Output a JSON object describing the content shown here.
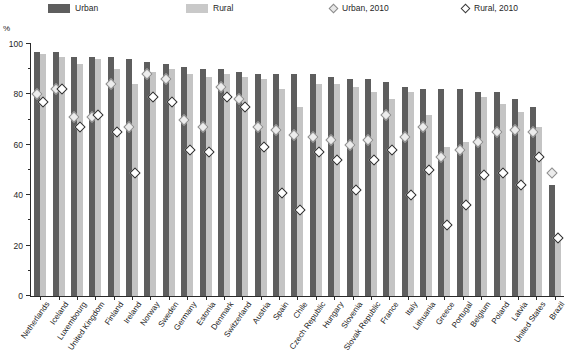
{
  "chart_data": {
    "type": "bar",
    "title": "",
    "subtitle": "",
    "xlabel": "",
    "ylabel": "%",
    "ylim": [
      0,
      100
    ],
    "ytick_values": [
      0,
      20,
      40,
      60,
      80,
      100
    ],
    "ytick_labels": [
      "0",
      "20",
      "40",
      "60",
      "80",
      "100"
    ],
    "yminor_values": [
      10,
      30,
      50,
      70,
      90
    ],
    "grid": false,
    "legend_position": "top",
    "categories": [
      "Netherlands",
      "Iceland",
      "Luxembourg",
      "United Kingdom",
      "Finland",
      "Ireland",
      "Norway",
      "Sweden",
      "Germany",
      "Estonia",
      "Denmark",
      "Switzerland",
      "Austria",
      "Spain",
      "Chile",
      "Czech Republic",
      "Hungary",
      "Slovenia",
      "Slovak Republic",
      "France",
      "Italy",
      "Lithuania",
      "Greece",
      "Portugal",
      "Belgium",
      "Poland",
      "Latvia",
      "United States",
      "Brazil"
    ],
    "series": [
      {
        "name": "Urban",
        "type": "bar",
        "color": "#5e5e5e",
        "values": [
          97,
          97,
          95,
          95,
          95,
          94,
          93,
          92,
          91,
          90,
          90,
          89,
          88,
          88,
          88,
          88,
          87,
          86,
          86,
          85,
          83,
          82,
          82,
          82,
          81,
          81,
          78,
          75,
          44
        ]
      },
      {
        "name": "Rural",
        "type": "bar",
        "color": "#c4c4c4",
        "values": [
          96,
          95,
          92,
          94,
          90,
          84,
          89,
          90,
          88,
          87,
          88,
          87,
          86,
          82,
          75,
          84,
          84,
          83,
          81,
          78,
          81,
          72,
          59,
          61,
          79,
          76,
          73,
          67,
          22
        ]
      },
      {
        "name": "Urban, 2010",
        "type": "scatter",
        "marker": "diamond",
        "color": "#ececec",
        "values": [
          80,
          82,
          71,
          71,
          84,
          67,
          88,
          86,
          70,
          67,
          83,
          78,
          67,
          66,
          64,
          63,
          62,
          60,
          62,
          72,
          63,
          67,
          55,
          58,
          61,
          65,
          66,
          65,
          49
        ]
      },
      {
        "name": "Rural, 2010",
        "type": "scatter",
        "marker": "diamond",
        "color": "#ffffff",
        "values": [
          77,
          82,
          67,
          72,
          65,
          49,
          79,
          77,
          58,
          57,
          79,
          75,
          59,
          41,
          34,
          57,
          54,
          42,
          54,
          58,
          40,
          50,
          28,
          36,
          48,
          49,
          44,
          55,
          23
        ]
      }
    ]
  },
  "legend": {
    "items": [
      {
        "label": "Urban",
        "icon": "dark-bar-swatch"
      },
      {
        "label": "Rural",
        "icon": "light-bar-swatch"
      },
      {
        "label": "Urban, 2010",
        "icon": "grey-diamond-marker"
      },
      {
        "label": "Rural, 2010",
        "icon": "white-diamond-marker"
      }
    ]
  },
  "axes": {
    "y_unit_label": "%"
  },
  "colors": {
    "urban_bar": "#5e5e5e",
    "rural_bar": "#c4c4c4",
    "urban_2010_marker": "#ececec",
    "rural_2010_marker": "#ffffff",
    "axis": "#2b2b2b",
    "background": "#ffffff"
  }
}
